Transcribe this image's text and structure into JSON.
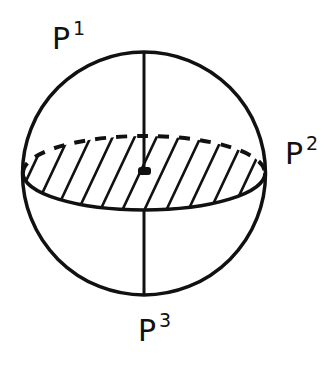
{
  "figure": {
    "type": "sphere-with-equatorial-plane",
    "stroke_color": "#111111",
    "background_color": "#ffffff",
    "labels": [
      {
        "id": "p1",
        "base": "P",
        "superscript": "1"
      },
      {
        "id": "p2",
        "base": "P",
        "superscript": "2"
      },
      {
        "id": "p3",
        "base": "P",
        "superscript": "3"
      }
    ],
    "elements": {
      "sphere_outline": "circle",
      "equatorial_plane": "hatched ellipse (dashed back edge, solid front edge)",
      "upper_axis": "vertical line from center to P1 pole",
      "lower_axis": "vertical line from front of equator to P3 pole",
      "center_point": "filled dot"
    }
  }
}
